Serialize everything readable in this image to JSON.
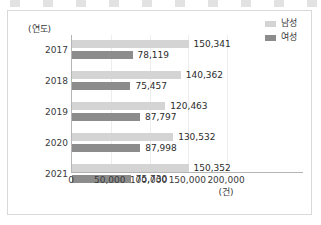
{
  "chart_data": {
    "type": "bar",
    "orientation": "horizontal",
    "title": "",
    "xlabel": "(건)",
    "ylabel": "(연도)",
    "categories": [
      "2017",
      "2018",
      "2019",
      "2020",
      "2021"
    ],
    "xlim": [
      0,
      200000
    ],
    "xticks": [
      0,
      50000,
      100000,
      150000,
      200000
    ],
    "xtick_labels": [
      "0",
      "50,000",
      "100,000",
      "150,000",
      "200,000"
    ],
    "grid": true,
    "grid_axis": "x",
    "legend_position": "top-right",
    "series": [
      {
        "name": "남성",
        "color": "#d4d4d4",
        "values": [
          150341,
          140362,
          120463,
          130532,
          150352
        ],
        "value_labels": [
          "150,341",
          "140,362",
          "120,463",
          "130,532",
          "150,352"
        ]
      },
      {
        "name": "여성",
        "color": "#8c8c8c",
        "values": [
          78119,
          75457,
          87797,
          87998,
          75730
        ],
        "value_labels": [
          "78,119",
          "75,457",
          "87,797",
          "87,998",
          "75,730"
        ]
      }
    ]
  },
  "legend": {
    "items": [
      {
        "label": "남성",
        "color": "#d4d4d4"
      },
      {
        "label": "여성",
        "color": "#8c8c8c"
      }
    ]
  },
  "axes": {
    "y_caption": "(연도)",
    "x_unit": "(건)"
  }
}
